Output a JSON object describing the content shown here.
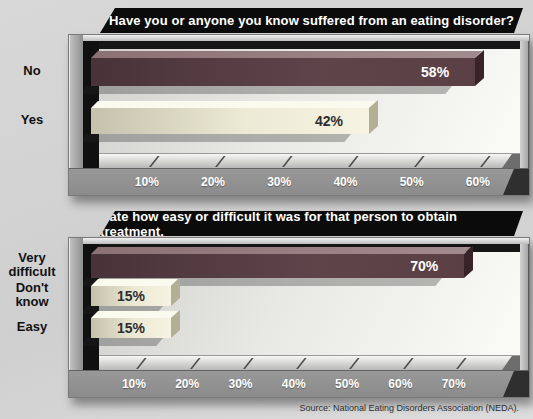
{
  "page": {
    "source_note": "Source: National Eating Disorders Association (NEDA)."
  },
  "colors": {
    "background": "#d4d4d4",
    "title_bar_bg": "#0b0b0b",
    "title_text": "#ffffff",
    "bar_maroon": "#5a3f45",
    "bar_cream": "#efecdc",
    "frame_gray": "#9d9d9d",
    "axis_text": "#ffffff"
  },
  "chart_data": [
    {
      "type": "bar",
      "orientation": "horizontal",
      "title": "Have you or anyone you know suffered from an eating disorder?",
      "categories": [
        "No",
        "Yes"
      ],
      "values": [
        58,
        42
      ],
      "value_labels": [
        "58%",
        "42%"
      ],
      "bar_colors": [
        "maroon",
        "cream"
      ],
      "value_label_colors": [
        "#ffffff",
        "#2e2e2e"
      ],
      "xticks": [
        10,
        20,
        30,
        40,
        50,
        60
      ],
      "xtick_labels": [
        "10%",
        "20%",
        "30%",
        "40%",
        "50%",
        "60%"
      ],
      "xlim": [
        0,
        66
      ],
      "xlabel": "",
      "ylabel": "",
      "grid": false,
      "legend": false
    },
    {
      "type": "bar",
      "orientation": "horizontal",
      "title": "Rate how easy or difficult it was for that person to obtain treatment.",
      "categories": [
        "Very difficult",
        "Don't know",
        "Easy"
      ],
      "values": [
        70,
        15,
        15
      ],
      "value_labels": [
        "70%",
        "15%",
        "15%"
      ],
      "bar_colors": [
        "maroon",
        "cream",
        "cream"
      ],
      "value_label_colors": [
        "#ffffff",
        "#2e2e2e",
        "#2e2e2e"
      ],
      "xticks": [
        10,
        20,
        30,
        40,
        50,
        60,
        70
      ],
      "xtick_labels": [
        "10%",
        "20%",
        "30%",
        "40%",
        "50%",
        "60%",
        "70%"
      ],
      "xlim": [
        0,
        82
      ],
      "xlabel": "",
      "ylabel": "",
      "grid": false,
      "legend": false
    }
  ]
}
